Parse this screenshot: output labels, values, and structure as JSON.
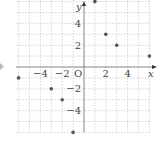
{
  "chart_data": {
    "type": "scatter",
    "title": "",
    "xlabel": "x",
    "ylabel": "y",
    "origin_label": "O",
    "xlim": [
      -6,
      6
    ],
    "ylim": [
      -6,
      6
    ],
    "grid": true,
    "grid_style": "dashed",
    "x_tick_labels": [
      "-4",
      "-2",
      "2",
      "4"
    ],
    "x_ticks": [
      -4,
      -2,
      2,
      4
    ],
    "y_tick_labels": [
      "4",
      "2",
      "-2",
      "-4"
    ],
    "y_ticks": [
      4,
      2,
      -2,
      -4
    ],
    "series": [
      {
        "name": "points",
        "points": [
          {
            "x": 1,
            "y": 6
          },
          {
            "x": 2,
            "y": 3
          },
          {
            "x": 3,
            "y": 2
          },
          {
            "x": 6,
            "y": 1
          },
          {
            "x": -6,
            "y": -1
          },
          {
            "x": -3,
            "y": -2
          },
          {
            "x": -2,
            "y": -3
          },
          {
            "x": -1,
            "y": -6
          }
        ]
      }
    ],
    "colors": {
      "point": "#555555",
      "axis": "#777777",
      "grid": "#bbbbbb",
      "marker_arrow": "#aaaaaa"
    }
  }
}
